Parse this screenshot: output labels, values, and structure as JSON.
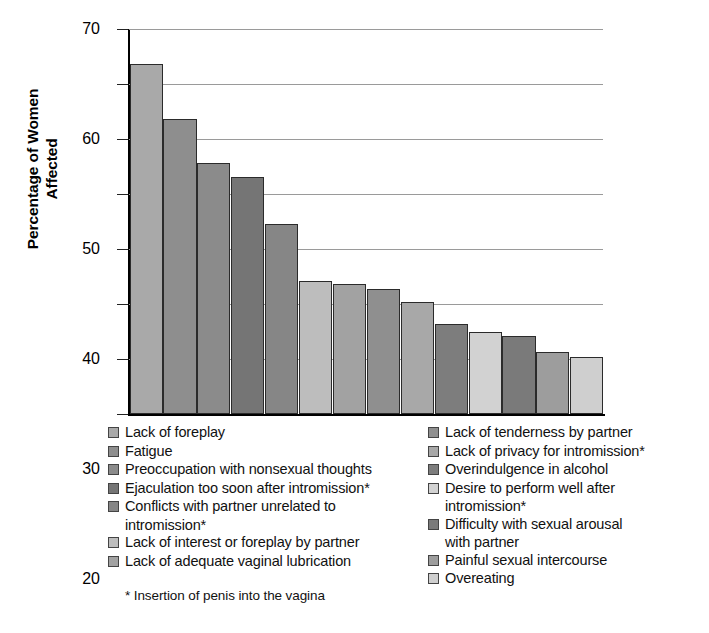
{
  "chart_data": {
    "type": "bar",
    "title": "",
    "xlabel": "",
    "ylabel": "Percentage of Women Affected",
    "ylim": [
      0,
      70
    ],
    "ytick_step": 10,
    "yticks": [
      "70",
      "60",
      "50",
      "40",
      "30",
      "20",
      "10",
      "0"
    ],
    "grid": true,
    "legend_position": "below-two-columns",
    "categories": [
      "Lack of foreplay",
      "Fatigue",
      "Preoccupation with nonsexual thoughts",
      "Ejaculation too soon after intromission*",
      "Conflicts with partner unrelated to intromission*",
      "Lack of interest or foreplay by partner",
      "Lack of adequate vaginal lubrication",
      "Lack of tenderness by partner",
      "Lack of privacy for intromission*",
      "Overindulgence in alcohol",
      "Desire to perform well after intromission*",
      "Difficulty with sexual arousal with partner",
      "Painful sexual intercourse",
      "Overeating"
    ],
    "values": [
      63.7,
      53.7,
      45.6,
      43.1,
      34.5,
      24.2,
      23.7,
      22.7,
      20.3,
      16.3,
      14.9,
      14.2,
      11.2,
      10.3
    ],
    "colors": [
      "#a9a9a9",
      "#8e8e8e",
      "#8b8b8b",
      "#757575",
      "#868686",
      "#bdbdbd",
      "#a2a2a2",
      "#8f8f8f",
      "#a8a8a8",
      "#7d7d7d",
      "#d2d2d2",
      "#7a7a7a",
      "#9d9d9d",
      "#cfcfcf"
    ]
  },
  "legend": {
    "left_column": [
      {
        "label": "Lack of foreplay",
        "cont": "",
        "color": "#a9a9a9"
      },
      {
        "label": "Fatigue",
        "cont": "",
        "color": "#8e8e8e"
      },
      {
        "label": "Preoccupation with nonsexual thoughts",
        "cont": "",
        "color": "#8b8b8b"
      },
      {
        "label": "Ejaculation too soon after intromission*",
        "cont": "",
        "color": "#757575"
      },
      {
        "label": "Conflicts with partner unrelated to",
        "cont": "intromission*",
        "color": "#868686"
      },
      {
        "label": "Lack of interest or foreplay by partner",
        "cont": "",
        "color": "#bdbdbd"
      },
      {
        "label": "Lack of adequate vaginal lubrication",
        "cont": "",
        "color": "#a2a2a2"
      }
    ],
    "right_column": [
      {
        "label": "Lack of tenderness by partner",
        "cont": "",
        "color": "#8f8f8f"
      },
      {
        "label": "Lack of privacy for intromission*",
        "cont": "",
        "color": "#a8a8a8"
      },
      {
        "label": "Overindulgence in alcohol",
        "cont": "",
        "color": "#7d7d7d"
      },
      {
        "label": "Desire to perform well after",
        "cont": "intromission*",
        "color": "#d2d2d2"
      },
      {
        "label": "Difficulty with sexual arousal",
        "cont": "with partner",
        "color": "#7a7a7a"
      },
      {
        "label": "Painful sexual intercourse",
        "cont": "",
        "color": "#9d9d9d"
      },
      {
        "label": "Overeating",
        "cont": "",
        "color": "#cfcfcf"
      }
    ]
  },
  "footnote": "* Insertion of penis into the vagina"
}
